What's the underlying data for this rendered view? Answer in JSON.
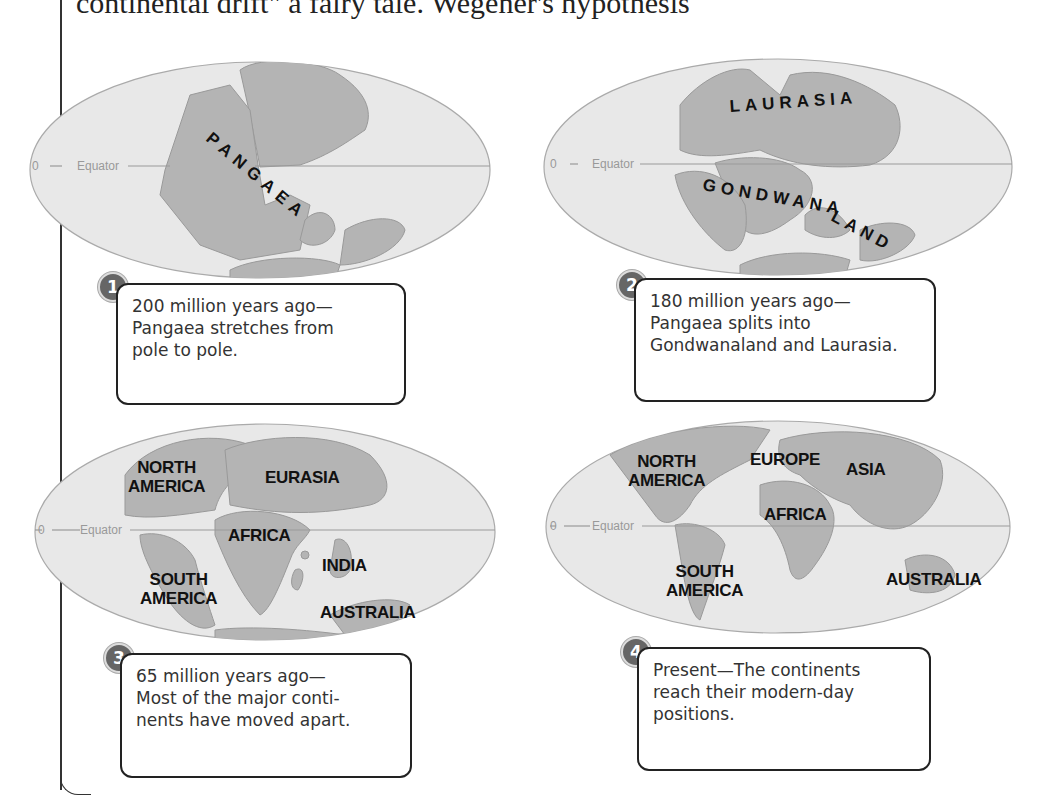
{
  "header_fragment": "continental drift\" a fairy tale. Wegener's hypothesis",
  "equator": {
    "zero": "0",
    "label": "Equator"
  },
  "panels": [
    {
      "number": "1",
      "caption_lines": [
        "200 million years ago—",
        "Pangaea stretches from",
        "pole to pole."
      ],
      "labels": [
        "PANGAEA"
      ]
    },
    {
      "number": "2",
      "caption_lines": [
        "180 million years ago—",
        "Pangaea splits into",
        "Gondwanaland and Laurasia."
      ],
      "labels": [
        "LAURASIA",
        "GONDWANALAND"
      ]
    },
    {
      "number": "3",
      "caption_lines": [
        "65 million years ago—",
        "Most of the major conti-",
        "nents have moved apart."
      ],
      "labels": [
        "NORTH",
        "AMERICA",
        "EURASIA",
        "AFRICA",
        "INDIA",
        "SOUTH",
        "AMERICA",
        "AUSTRALIA"
      ]
    },
    {
      "number": "4",
      "caption_lines": [
        "Present—The continents",
        "reach their modern-day",
        "positions."
      ],
      "labels": [
        "NORTH",
        "AMERICA",
        "EUROPE",
        "ASIA",
        "AFRICA",
        "SOUTH",
        "AMERICA",
        "AUSTRALIA"
      ]
    }
  ],
  "colors": {
    "ocean": "#e8e8e8",
    "land": "#b4b4b4",
    "outline": "#999999",
    "badge": "#666666"
  }
}
